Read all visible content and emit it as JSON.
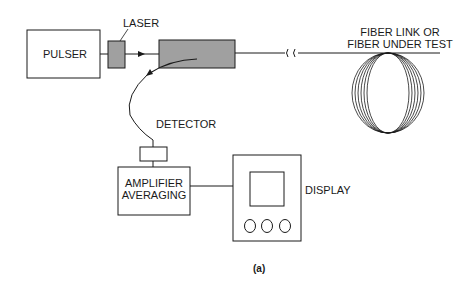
{
  "diagram": {
    "type": "block-diagram",
    "title": "",
    "caption": "(a)",
    "blocks": [
      {
        "id": "pulser",
        "label": "PULSER"
      },
      {
        "id": "laser",
        "label": "LASER"
      },
      {
        "id": "coupler",
        "label": ""
      },
      {
        "id": "detector",
        "label": "DETECTOR"
      },
      {
        "id": "amplifier",
        "label_line1": "AMPLIFIER",
        "label_line2": "AVERAGING"
      },
      {
        "id": "display",
        "label": "DISPLAY"
      },
      {
        "id": "fiber",
        "label_line1": "FIBER LINK OR",
        "label_line2": "FIBER UNDER TEST"
      }
    ],
    "connections": [
      [
        "pulser",
        "laser"
      ],
      [
        "laser",
        "coupler"
      ],
      [
        "coupler",
        "fiber"
      ],
      [
        "coupler",
        "detector"
      ],
      [
        "detector",
        "amplifier"
      ],
      [
        "amplifier",
        "display"
      ]
    ],
    "colors": {
      "line": "#1a1a1a",
      "shaded": "#a0a0a0",
      "background": "#ffffff"
    }
  }
}
